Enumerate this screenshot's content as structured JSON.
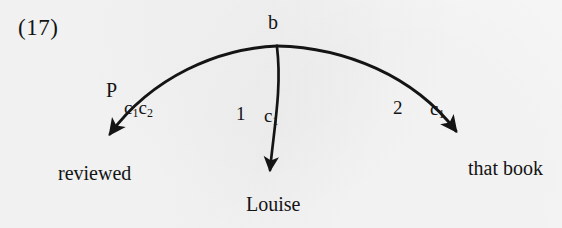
{
  "figure": {
    "example_number": "(17)",
    "root_node": "b",
    "ink_color": "#141414",
    "paper_color": "#f6f6f6"
  },
  "arcs": [
    {
      "id": "arc-left",
      "relation_label": "P",
      "coindex_label": "c",
      "coindex_sub_1": "1",
      "coindex_label_2": "c",
      "coindex_sub_2": "2",
      "target": "reviewed"
    },
    {
      "id": "arc-middle",
      "relation_label": "1",
      "coindex_label": "c",
      "coindex_sub_1": "1",
      "target": "Louise"
    },
    {
      "id": "arc-right",
      "relation_label": "2",
      "coindex_label": "c",
      "coindex_sub_1": "1",
      "target": "that book"
    }
  ],
  "leaves": {
    "left": "reviewed",
    "middle": "Louise",
    "right": "that book"
  }
}
